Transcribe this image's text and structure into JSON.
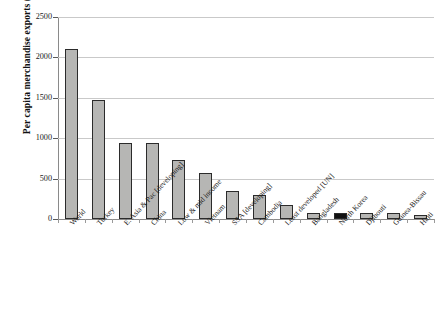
{
  "chart_data": {
    "type": "bar",
    "title": "",
    "xlabel": "",
    "ylabel": "Per capita merchandise exports ($)",
    "ylim": [
      0,
      2500
    ],
    "yticks": [
      0,
      500,
      1000,
      1500,
      2000,
      2500
    ],
    "ytick_labels": [
      "0",
      "500",
      "1000",
      "1500",
      "2000",
      "2500"
    ],
    "grid": true,
    "legend": "none",
    "highlight_category": "North Korea",
    "highlight_color": "#111111",
    "bar_color": "#b6b6b4",
    "bar_edge_color": "#2b2b2b",
    "categories": [
      "World",
      "Turkey",
      "E. Asia & Pac [developing]",
      "China",
      "Low & mid income",
      "Vietnam",
      "SSA [developing]",
      "Cambodia",
      "Least developed [UN]",
      "Bangladesh",
      "North Korea",
      "Djibouti",
      "Guinea-Bissau",
      "Haiti"
    ],
    "values": [
      2110,
      1470,
      945,
      940,
      730,
      565,
      345,
      300,
      175,
      75,
      75,
      70,
      70,
      55
    ]
  },
  "caption": {
    "text": ""
  }
}
